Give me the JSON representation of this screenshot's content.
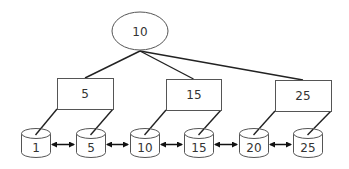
{
  "diagram": {
    "type": "tree",
    "root": {
      "label": "10",
      "cx": 140,
      "cy": 31,
      "rx": 28,
      "ry": 19
    },
    "internal_nodes": [
      {
        "label": "5",
        "x": 57,
        "y": 78,
        "w": 56,
        "h": 31
      },
      {
        "label": "15",
        "x": 166,
        "y": 79,
        "w": 55,
        "h": 31
      },
      {
        "label": "25",
        "x": 275,
        "y": 80,
        "w": 56,
        "h": 31
      }
    ],
    "leaves": [
      {
        "label": "1",
        "x": 21
      },
      {
        "label": "5",
        "x": 76
      },
      {
        "label": "10",
        "x": 130
      },
      {
        "label": "15",
        "x": 184
      },
      {
        "label": "20",
        "x": 239
      },
      {
        "label": "25",
        "x": 293
      }
    ],
    "leaf_style": {
      "y": 128,
      "w": 29,
      "h": 29,
      "cap": 5
    },
    "colors": {
      "stroke": "#555555",
      "edge": "#222222",
      "fill": "#ffffff",
      "text": "#333333"
    }
  }
}
